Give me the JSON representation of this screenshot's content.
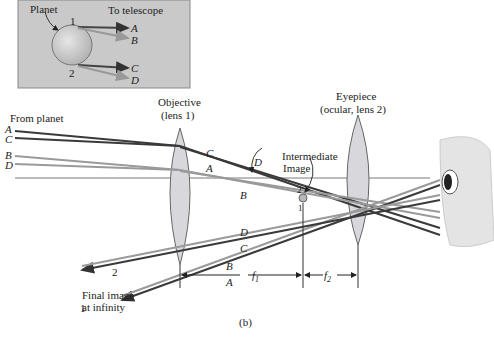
{
  "inset": {
    "planet_label": "Planet",
    "telescope_label": "To telescope",
    "point1": "1",
    "point2": "2",
    "rays": [
      "A",
      "B",
      "C",
      "D"
    ],
    "background": "#c9c9c9"
  },
  "main": {
    "from_planet": "From planet",
    "objective_line1": "Objective",
    "objective_line2": "(lens 1)",
    "eyepiece_line1": "Eyepiece",
    "eyepiece_line2": "(ocular, lens 2)",
    "intermediate_line1": "Intermediate",
    "intermediate_line2": "Image",
    "ray_A": "A",
    "ray_B": "B",
    "ray_C": "C",
    "ray_D": "D",
    "img_point_1": "1",
    "img_point_2": "2",
    "out_2": "2",
    "out_1": "1",
    "f1": "f",
    "f1_sub": "1",
    "f2": "f",
    "f2_sub": "2",
    "final_line1": "Final image",
    "final_line2": "at infinity",
    "caption": "(b)"
  },
  "colors": {
    "dark_ray": "#3a3a3a",
    "light_ray": "#9a9a9a",
    "lens_fill": "#d8d8dc",
    "axis": "#7a7a7a"
  }
}
